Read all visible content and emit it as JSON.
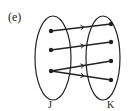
{
  "figure_label": "(e)",
  "sets": [
    {
      "name": "J",
      "elements": [
        "j1",
        "j2",
        "j3"
      ]
    },
    {
      "name": "K",
      "elements": [
        "k1",
        "k2",
        "k3",
        "k4"
      ]
    }
  ],
  "mappings": [
    {
      "from": "j1",
      "to": "k1"
    },
    {
      "from": "j2",
      "to": "k2"
    },
    {
      "from": "j3",
      "to": "k3"
    },
    {
      "from": "j3",
      "to": "k4"
    }
  ],
  "colors": {
    "stroke": "#222222",
    "background": "#ffffff"
  }
}
